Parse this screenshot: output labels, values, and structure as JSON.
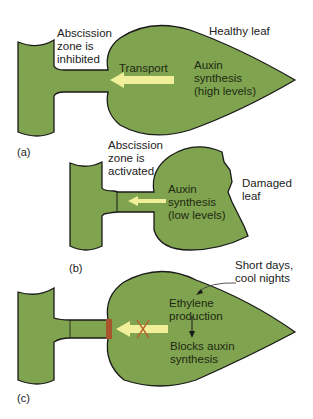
{
  "colors": {
    "leaf_fill": "#7fa34f",
    "outline": "#1a1a1a",
    "arrow": "#f2ef9a",
    "block_bar": "#a8552c",
    "x_mark": "#b5652f",
    "text": "#222222"
  },
  "panels": [
    {
      "id": "a",
      "label": "(a)",
      "title": "Healthy leaf",
      "zone_label": "Abscission\nzone is\ninhibited",
      "arrow_label": "Transport",
      "leaf_text": "Auxin\nsynthesis\n(high levels)"
    },
    {
      "id": "b",
      "label": "(b)",
      "zone_label": "Abscission\nzone is\nactivated",
      "leaf_text": "Auxin\nsynthesis\n(low levels)",
      "side_label": "Damaged\nleaf"
    },
    {
      "id": "c",
      "label": "(c)",
      "callout": "Short days,\ncool nights",
      "step1": "Ethylene\nproduction",
      "step2": "Blocks auxin\nsynthesis"
    }
  ]
}
